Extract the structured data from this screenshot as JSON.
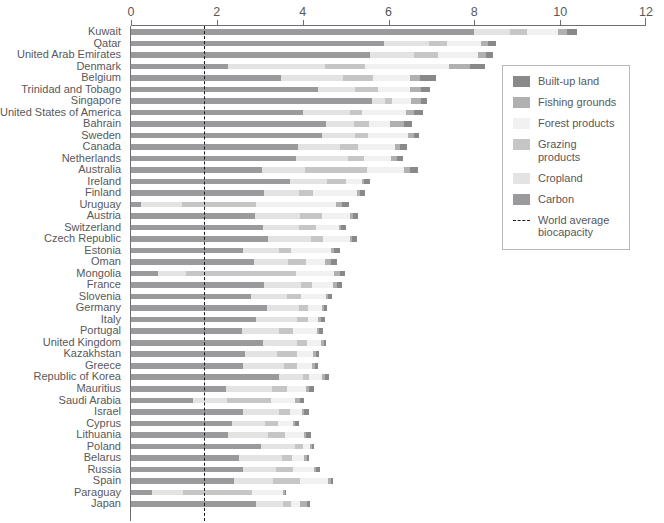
{
  "chart_data": {
    "type": "bar",
    "orientation": "horizontal",
    "title": "",
    "subtitle": "",
    "xlabel": "",
    "ylabel": "",
    "xlim": [
      0,
      12
    ],
    "xticks": [
      0,
      2,
      4,
      6,
      8,
      10,
      12
    ],
    "xtick_labels": [
      "0",
      "2",
      "4",
      "6",
      "8",
      "10",
      "12"
    ],
    "grid": false,
    "stacked": true,
    "legend_position": "right",
    "series_order": [
      "Carbon",
      "Cropland",
      "Grazing products",
      "Forest products",
      "Fishing grounds",
      "Built-up land"
    ],
    "series_colors": {
      "Built-up land": "#898989",
      "Fishing grounds": "#b0b0b1",
      "Forest products": "#f1f1f1",
      "Grazing products": "#c6c6c7",
      "Cropland": "#e3e3e3",
      "Carbon": "#9a9a9c"
    },
    "reference_line": {
      "label": "World average biocapacity",
      "value": 1.7,
      "style": "dashed",
      "color": "#1c1c1c"
    },
    "categories": [
      "Kuwait",
      "Qatar",
      "United Arab Emirates",
      "Denmark",
      "Belgium",
      "Trinidad and Tobago",
      "Singapore",
      "United States of America",
      "Bahrain",
      "Sweden",
      "Canada",
      "Netherlands",
      "Australia",
      "Ireland",
      "Finland",
      "Uruguay",
      "Austria",
      "Switzerland",
      "Czech Republic",
      "Estonia",
      "Oman",
      "Mongolia",
      "France",
      "Slovenia",
      "Germany",
      "Italy",
      "Portugal",
      "United Kingdom",
      "Kazakhstan",
      "Greece",
      "Republic of Korea",
      "Mauritius",
      "Saudi Arabia",
      "Israel",
      "Cyprus",
      "Lithuania",
      "Poland",
      "Belarus",
      "Russia",
      "Spain",
      "Paraguay",
      "Japan"
    ],
    "totals": [
      10.4,
      8.5,
      8.44,
      8.26,
      7.11,
      6.97,
      6.9,
      6.81,
      6.55,
      6.72,
      6.43,
      6.34,
      6.68,
      5.57,
      5.46,
      5.08,
      5.3,
      5.01,
      5.27,
      4.86,
      4.79,
      4.98,
      4.91,
      4.68,
      4.57,
      4.52,
      4.48,
      4.54,
      4.39,
      4.36,
      4.62,
      4.26,
      4.04,
      4.14,
      3.91,
      4.2,
      4.27,
      4.15,
      4.4,
      4.7,
      3.62,
      4.17
    ],
    "values": {
      "Carbon": [
        7.99,
        5.9,
        5.58,
        2.26,
        3.5,
        4.35,
        5.62,
        4.0,
        4.54,
        4.45,
        3.89,
        3.84,
        3.05,
        3.71,
        3.1,
        0.24,
        2.9,
        3.08,
        3.2,
        2.6,
        2.86,
        0.64,
        3.1,
        2.8,
        3.16,
        2.92,
        2.58,
        3.07,
        2.66,
        2.6,
        3.44,
        2.22,
        1.45,
        2.62,
        2.36,
        2.25,
        3.02,
        2.52,
        2.62,
        2.41,
        0.5,
        2.92
      ],
      "Cropland": [
        0.85,
        1.05,
        1.02,
        2.25,
        1.45,
        0.88,
        0.31,
        1.1,
        0.66,
        0.78,
        0.97,
        1.22,
        1.01,
        0.86,
        0.82,
        0.96,
        1.03,
        0.84,
        1.0,
        0.86,
        0.8,
        0.65,
        0.86,
        0.84,
        0.76,
        0.94,
        0.86,
        0.8,
        0.74,
        0.96,
        0.56,
        1.06,
        0.78,
        0.82,
        0.76,
        0.94,
        0.8,
        1.0,
        0.76,
        0.9,
        0.72,
        0.62
      ],
      "Grazing products": [
        0.38,
        0.42,
        0.55,
        0.95,
        0.68,
        0.52,
        0.16,
        0.28,
        0.35,
        0.3,
        0.44,
        0.38,
        1.45,
        0.45,
        0.32,
        1.72,
        0.52,
        0.4,
        0.28,
        0.26,
        0.42,
        2.56,
        0.26,
        0.32,
        0.2,
        0.26,
        0.34,
        0.24,
        0.46,
        0.32,
        0.14,
        0.36,
        1.04,
        0.26,
        0.3,
        0.4,
        0.18,
        0.24,
        0.4,
        0.62,
        1.6,
        0.18
      ],
      "Forest products": [
        0.74,
        0.78,
        0.93,
        1.95,
        0.88,
        0.74,
        0.44,
        1.02,
        0.48,
        0.92,
        0.86,
        0.62,
        0.86,
        0.36,
        1.02,
        1.86,
        0.66,
        0.52,
        0.62,
        0.94,
        0.44,
        0.88,
        0.48,
        0.58,
        0.32,
        0.24,
        0.56,
        0.32,
        0.38,
        0.34,
        0.3,
        0.44,
        0.56,
        0.28,
        0.36,
        0.44,
        0.16,
        0.28,
        0.48,
        0.66,
        0.72,
        0.22
      ],
      "Fishing grounds": [
        0.2,
        0.18,
        0.2,
        0.5,
        0.22,
        0.26,
        0.22,
        0.2,
        0.34,
        0.14,
        0.12,
        0.14,
        0.14,
        0.06,
        0.08,
        0.14,
        0.06,
        0.06,
        0.06,
        0.06,
        0.14,
        0.14,
        0.1,
        0.04,
        0.06,
        0.06,
        0.04,
        0.06,
        0.06,
        0.06,
        0.08,
        0.08,
        0.12,
        0.06,
        0.04,
        0.06,
        0.05,
        0.05,
        0.06,
        0.06,
        0.04,
        0.15
      ],
      "Built-up land": [
        0.24,
        0.17,
        0.16,
        0.35,
        0.38,
        0.22,
        0.15,
        0.21,
        0.18,
        0.13,
        0.15,
        0.14,
        0.17,
        0.13,
        0.12,
        0.16,
        0.13,
        0.11,
        0.11,
        0.14,
        0.13,
        0.11,
        0.11,
        0.1,
        0.07,
        0.1,
        0.1,
        0.05,
        0.09,
        0.08,
        0.1,
        0.1,
        0.09,
        0.1,
        0.09,
        0.11,
        0.06,
        0.06,
        0.08,
        0.05,
        0.04,
        0.08
      ]
    }
  },
  "legend": {
    "items": [
      {
        "label": "Built-up land",
        "color": "#898989",
        "kind": "swatch"
      },
      {
        "label": "Fishing grounds",
        "color": "#b0b0b1",
        "kind": "swatch"
      },
      {
        "label": "Forest products",
        "color": "#f1f1f1",
        "kind": "swatch"
      },
      {
        "label": "Grazing products",
        "color": "#c6c6c7",
        "kind": "swatch"
      },
      {
        "label": "Cropland",
        "color": "#e3e3e3",
        "kind": "swatch"
      },
      {
        "label": "Carbon",
        "color": "#9a9a9c",
        "kind": "swatch"
      },
      {
        "label": "World average\nbiocapacity",
        "color": "#1c1c1c",
        "kind": "dash"
      }
    ]
  },
  "colors": {
    "axis": "#6f6f71",
    "text": "#58585a",
    "background": "#ffffff",
    "reference_line": "#1c1c1c",
    "legend_border": "#b9b9ba"
  }
}
